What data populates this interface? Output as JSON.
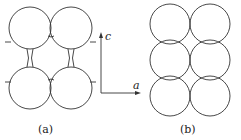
{
  "figure": {
    "panels": [
      {
        "id": "a",
        "label": "(a)",
        "arrangement": "2x2 spheres separated vertically, joined by necks",
        "rows": 2,
        "cols": 2
      },
      {
        "id": "b",
        "label": "(b)",
        "arrangement": "3x2 close-packed spheres",
        "rows": 3,
        "cols": 2
      }
    ],
    "axes": {
      "vertical": "c",
      "horizontal": "a"
    },
    "colors": {
      "stroke": "#333333",
      "background": "#ffffff"
    }
  }
}
